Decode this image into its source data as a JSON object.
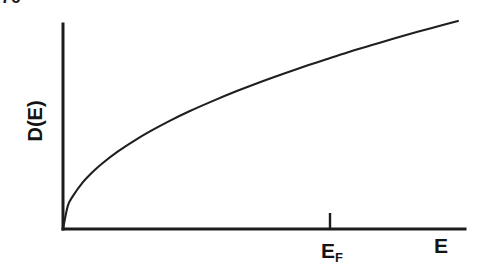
{
  "page": {
    "page_number": "76",
    "background_color": "#ffffff",
    "ink_color": "#1a1a1a"
  },
  "figure": {
    "name": "density-of-states-vs-energy",
    "ylabel": "D(E)",
    "xlabel": "E",
    "fermi_label_main": "E",
    "fermi_label_sub": "F"
  },
  "chart_data": {
    "type": "line",
    "title": "",
    "subtitle": "",
    "xlabel": "E",
    "ylabel": "D(E)",
    "grid": false,
    "legend": null,
    "axis_style": {
      "y_axis_x_px": 63,
      "y_axis_top_px": 24,
      "x_axis_y_px": 229,
      "x_axis_right_px": 465,
      "arrowheads": false,
      "tick_labels_numeric": false
    },
    "xlim": [
      0,
      1
    ],
    "ylim": [
      0,
      1
    ],
    "annotations": [
      {
        "text": "E_F",
        "x": 0.665,
        "y": 0,
        "type": "axis-tick",
        "tick_pixel_x": 330,
        "tick_pixel_top": 213,
        "tick_pixel_bottom": 229
      }
    ],
    "series": [
      {
        "name": "D(E) ~ sqrt(E)",
        "color": "#1f1f1f",
        "x": [
          0.0,
          0.012,
          0.025,
          0.05,
          0.075,
          0.1,
          0.14,
          0.18,
          0.22,
          0.27,
          0.32,
          0.38,
          0.44,
          0.5,
          0.56,
          0.62,
          0.665,
          0.72,
          0.78,
          0.84,
          0.9,
          0.95,
          1.0
        ],
        "y": [
          0.0,
          0.11,
          0.158,
          0.224,
          0.274,
          0.316,
          0.374,
          0.424,
          0.469,
          0.52,
          0.566,
          0.616,
          0.663,
          0.707,
          0.748,
          0.787,
          0.815,
          0.849,
          0.883,
          0.917,
          0.949,
          0.975,
          1.0
        ]
      }
    ]
  }
}
